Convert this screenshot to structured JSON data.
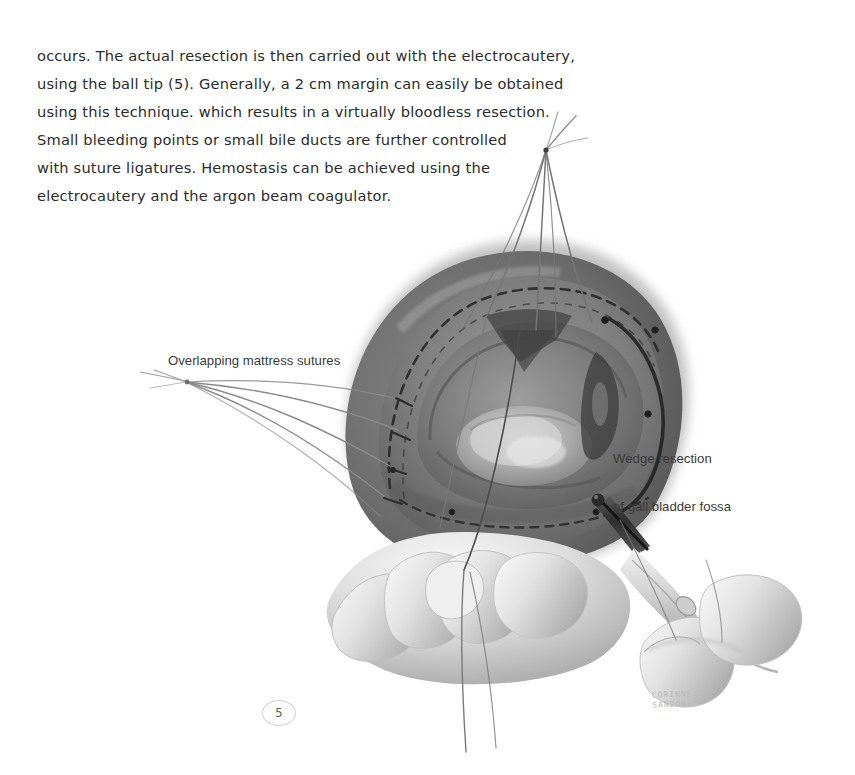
{
  "page": {
    "background_color": "#ffffff",
    "number": "5"
  },
  "body_text": {
    "lines": [
      "occurs. The actual resection is then carried out with the electrocautery,",
      "using the ball tip (5). Generally, a 2 cm margin can easily be obtained",
      "using this technique. which results in a virtually bloodless resection.",
      "Small bleeding points or small bile ducts are further controlled",
      "with suture ligatures. Hemostasis can be achieved using the",
      "electrocautery and the argon beam coagulator."
    ],
    "color": "#2b2b2b"
  },
  "illustration": {
    "title": "Wedge resection of the gall bladder fossa of the liver",
    "medium": "grayscale medical illustration",
    "labels": {
      "left": "Overlapping mattress sutures",
      "right_line1": "Wedge resection",
      "right_line2": "of gall bladder fossa"
    },
    "signature": "CORINNE\nSANDONE",
    "palette": {
      "liver_dark": "#6f6f6f",
      "liver_mid": "#8f8f8f",
      "liver_light": "#b5b5b5",
      "cavity": "#7a7a7a",
      "tumor": "#c8c8c8",
      "suture": "#4a4a4a",
      "instrument_dark": "#3a3a3a",
      "glove": "#d8d8d8",
      "glove_shadow": "#a9a9a9"
    }
  }
}
